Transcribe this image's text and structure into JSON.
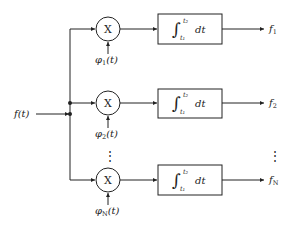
{
  "diagram": {
    "type": "correlator-bank",
    "input": {
      "label": "f(t)"
    },
    "multiplier_symbol": "X",
    "integrator": {
      "symbol": "∫",
      "upper_limit": "t₂",
      "lower_limit": "t₁",
      "differential": "dt"
    },
    "branches": [
      {
        "ref_base": "φ",
        "ref_sub": "1",
        "ref_arg": "(t)",
        "out_base": "f",
        "out_sub": "1"
      },
      {
        "ref_base": "φ",
        "ref_sub": "2",
        "ref_arg": "(t)",
        "out_base": "f",
        "out_sub": "2"
      },
      {
        "ref_base": "φ",
        "ref_sub": "N",
        "ref_arg": "(t)",
        "out_base": "f",
        "out_sub": "N"
      }
    ],
    "ellipsis": "⋮",
    "colors": {
      "line": "#222222",
      "background": "#ffffff"
    }
  }
}
